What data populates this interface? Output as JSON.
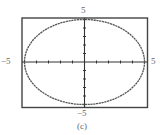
{
  "chart_data": {
    "type": "line",
    "title": "",
    "caption": "(c)",
    "xlim": [
      -5,
      5
    ],
    "ylim": [
      -5,
      5
    ],
    "x_tick_step": 1,
    "y_tick_step": 1,
    "axis_labels": {
      "x_min": "−5",
      "x_max": "5",
      "y_min": "−5",
      "y_max": "5"
    },
    "series": [
      {
        "name": "curve",
        "shape": "ellipse",
        "center": [
          0,
          0
        ],
        "x_radius": 5,
        "y_radius": 5,
        "color": "#555555"
      }
    ],
    "grid": false,
    "legend": null
  },
  "colors": {
    "frame": "#444444",
    "axes": "#333333",
    "curve": "#555555"
  }
}
